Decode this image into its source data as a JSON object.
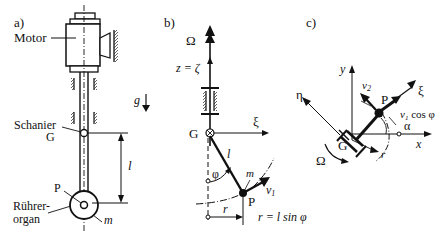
{
  "panels": {
    "a": {
      "label": "a)",
      "motor": "Motor",
      "gravity": "g",
      "hinge_line1": "Schanier",
      "hinge_line2": "G",
      "length": "l",
      "point": "P",
      "stirrer_line1": "Rührer-",
      "stirrer_line2": "organ",
      "mass": "m"
    },
    "b": {
      "label": "b)",
      "omega": "Ω",
      "axis": "z = ζ",
      "hinge": "G",
      "xi": "ξ",
      "length": "l",
      "phi": "φ",
      "mass": "m",
      "velocity": "v",
      "velocity_sub": "1",
      "point": "P",
      "radius": "r",
      "formula": "r = l  sin φ"
    },
    "c": {
      "label": "c)",
      "y": "y",
      "v2": "v",
      "v2_sub": "2",
      "eta": "η",
      "point": "P",
      "xi": "ξ",
      "v1cos": "v",
      "v1cos_sub": "1",
      "v1cos_rest": " cos φ",
      "alpha": "α",
      "hinge": "G",
      "x": "x",
      "radius": "r",
      "omega": "Ω"
    }
  }
}
